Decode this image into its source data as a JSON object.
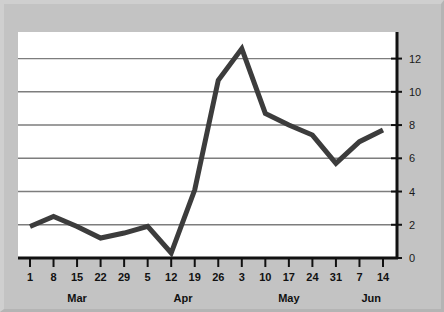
{
  "figure": {
    "background_color": "#c3c3c3",
    "plot_background_color": "#ffffff",
    "line_color": "#3c3c3c",
    "grid_color": "#7d7d7d",
    "axis_color": "#111111"
  },
  "chart_data": {
    "type": "line",
    "title": "",
    "subtitle": "",
    "xlabel": "",
    "ylabel": "",
    "grid": true,
    "legend": "none",
    "categories": [
      "1",
      "8",
      "15",
      "22",
      "29",
      "5",
      "12",
      "19",
      "26",
      "3",
      "10",
      "17",
      "24",
      "31",
      "7",
      "14"
    ],
    "month_groups": [
      {
        "label": "Mar",
        "start_index": 0,
        "end_index": 4
      },
      {
        "label": "Apr",
        "start_index": 5,
        "end_index": 8
      },
      {
        "label": "May",
        "start_index": 9,
        "end_index": 13
      },
      {
        "label": "Jun",
        "start_index": 14,
        "end_index": 15
      }
    ],
    "series": [
      {
        "name": "series-1",
        "values": [
          1.9,
          2.5,
          1.9,
          1.2,
          1.5,
          1.9,
          0.3,
          4.1,
          10.7,
          12.6,
          8.7,
          8.0,
          7.4,
          5.7,
          7.0,
          7.7
        ]
      }
    ],
    "x_tick_labels": [
      "1",
      "8",
      "15",
      "22",
      "29",
      "5",
      "12",
      "19",
      "26",
      "3",
      "10",
      "17",
      "24",
      "31",
      "7",
      "14"
    ],
    "y_tick_labels": [
      "0",
      "2",
      "4",
      "6",
      "8",
      "10",
      "12"
    ],
    "y_ticks": [
      0,
      2,
      4,
      6,
      8,
      10,
      12
    ],
    "ylim": [
      0,
      13.6
    ],
    "xlim": [
      0,
      15
    ],
    "y_axis_position": "right",
    "x_axis_position": "bottom"
  }
}
